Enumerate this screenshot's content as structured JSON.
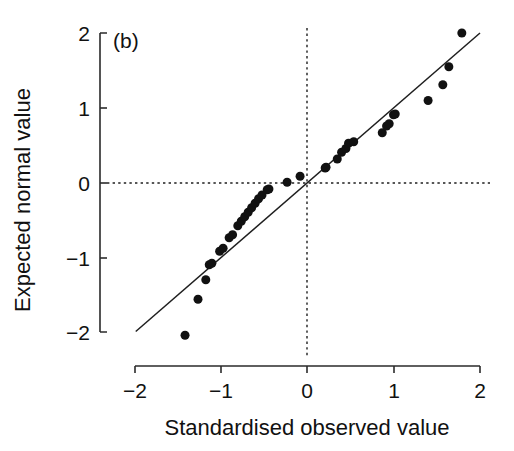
{
  "figure": {
    "panel_label": "(b)",
    "background_color": "#ffffff",
    "ink_color": "#111111"
  },
  "chart_data": {
    "type": "scatter",
    "title": "",
    "subtitle": "",
    "panel_label": "(b)",
    "xlabel": "Standardised observed value",
    "ylabel": "Expected normal value",
    "xlim": [
      -2,
      2
    ],
    "ylim": [
      -2,
      2
    ],
    "xticks": [
      -2,
      -1,
      0,
      1,
      2
    ],
    "yticks": [
      -2,
      -1,
      0,
      1,
      2
    ],
    "xtick_labels": [
      "−2",
      "−1",
      "0",
      "1",
      "2"
    ],
    "ytick_labels": [
      "−2",
      "−1",
      "0",
      "1",
      "2"
    ],
    "grid": false,
    "legend": null,
    "legend_position": "none",
    "marker": "filled-circle",
    "marker_color": "#111111",
    "marker_size_px": 9,
    "series": [
      {
        "name": "Observed vs expected normal quantiles",
        "points": [
          [
            -1.41,
            -2.03
          ],
          [
            -1.26,
            -1.55
          ],
          [
            -1.17,
            -1.29
          ],
          [
            -1.13,
            -1.09
          ],
          [
            -1.1,
            -1.07
          ],
          [
            -1.01,
            -0.91
          ],
          [
            -0.97,
            -0.87
          ],
          [
            -0.9,
            -0.73
          ],
          [
            -0.86,
            -0.69
          ],
          [
            -0.8,
            -0.57
          ],
          [
            -0.76,
            -0.51
          ],
          [
            -0.72,
            -0.45
          ],
          [
            -0.68,
            -0.39
          ],
          [
            -0.64,
            -0.33
          ],
          [
            -0.6,
            -0.27
          ],
          [
            -0.56,
            -0.21
          ],
          [
            -0.52,
            -0.16
          ],
          [
            -0.46,
            -0.09
          ],
          [
            -0.44,
            -0.08
          ],
          [
            -0.23,
            0.01
          ],
          [
            -0.08,
            0.09
          ],
          [
            0.21,
            0.2
          ],
          [
            0.22,
            0.21
          ],
          [
            0.35,
            0.32
          ],
          [
            0.4,
            0.41
          ],
          [
            0.45,
            0.46
          ],
          [
            0.48,
            0.53
          ],
          [
            0.54,
            0.55
          ],
          [
            0.87,
            0.67
          ],
          [
            0.92,
            0.76
          ],
          [
            0.95,
            0.79
          ],
          [
            1.0,
            0.91
          ],
          [
            1.02,
            0.92
          ],
          [
            1.4,
            1.1
          ],
          [
            1.57,
            1.31
          ],
          [
            1.64,
            1.55
          ],
          [
            1.79,
            2.0
          ]
        ]
      }
    ],
    "reference_lines": [
      {
        "name": "identity-fit-line",
        "style": "solid",
        "from": [
          -1.98,
          -1.98
        ],
        "to": [
          2.0,
          2.0
        ]
      },
      {
        "name": "zero-vertical-reference",
        "style": "dotted",
        "orientation": "vertical",
        "value": 0
      },
      {
        "name": "zero-horizontal-reference",
        "style": "dotted",
        "orientation": "horizontal",
        "value": 0
      }
    ]
  }
}
